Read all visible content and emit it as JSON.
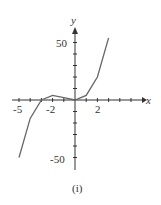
{
  "chart_data": {
    "type": "line",
    "title": "",
    "caption": "(i)",
    "xlabel": "x",
    "ylabel": "y",
    "xlim": [
      -5.5,
      5.5
    ],
    "ylim": [
      -60,
      62
    ],
    "x_ticks_labeled": [
      "-5",
      "-2",
      "2"
    ],
    "y_ticks_labeled": [
      "50",
      "-50"
    ],
    "series": [
      {
        "name": "f",
        "x": [
          -5,
          -4,
          -3,
          -2,
          -1,
          0,
          1,
          2,
          3
        ],
        "values": [
          -50,
          -16,
          0,
          4,
          2,
          0,
          4,
          20,
          54
        ]
      }
    ]
  },
  "labels": {
    "x": "x",
    "y": "y",
    "caption": "(i)",
    "xm5": "-5",
    "xm2": "-2",
    "x2": "2",
    "y50": "50",
    "ym50": "-50"
  }
}
